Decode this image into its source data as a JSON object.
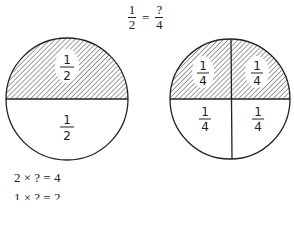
{
  "title": {
    "left": {
      "numerator": "1",
      "denominator": "2"
    },
    "equals": "=",
    "right": {
      "numerator": "?",
      "denominator": "4"
    }
  },
  "circles": [
    {
      "name": "halves",
      "cx": 67,
      "cy": 99,
      "r": 61,
      "regions": [
        {
          "label_num": "1",
          "label_den": "2",
          "shaded": true
        },
        {
          "label_num": "1",
          "label_den": "2",
          "shaded": false
        }
      ]
    },
    {
      "name": "quarters",
      "cx": 230,
      "cy": 99,
      "r": 60,
      "regions": [
        {
          "label_num": "1",
          "label_den": "4",
          "shaded": true
        },
        {
          "label_num": "1",
          "label_den": "4",
          "shaded": true
        },
        {
          "label_num": "1",
          "label_den": "4",
          "shaded": false
        },
        {
          "label_num": "1",
          "label_den": "4",
          "shaded": false
        }
      ]
    }
  ],
  "equations": [
    "2 × ? = 4",
    "1 × ? = 2"
  ],
  "colors": {
    "ink": "#222222",
    "background": "#ffffff"
  }
}
